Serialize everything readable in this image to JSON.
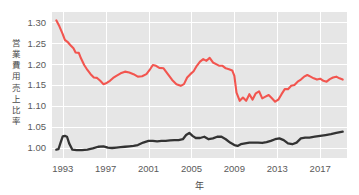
{
  "chart_data": {
    "type": "line",
    "title": "",
    "xlabel": "年",
    "ylabel": "営業費用売上比率",
    "xlim": [
      1992.0,
      2019.5
    ],
    "ylim": [
      0.975,
      1.325
    ],
    "grid": true,
    "legend": "none",
    "xticks": [
      1993,
      1997,
      2001,
      2005,
      2009,
      2013,
      2017
    ],
    "xtick_labels": [
      "1993",
      "1997",
      "2001",
      "2005",
      "2009",
      "2013",
      "2017"
    ],
    "yticks": [
      1.0,
      1.05,
      1.1,
      1.15,
      1.2,
      1.25,
      1.3
    ],
    "ytick_labels": [
      "1.00",
      "1.05",
      "1.10",
      "1.15",
      "1.20",
      "1.25",
      "1.30"
    ],
    "colors": {
      "series_red": "#f2554f",
      "series_black": "#333333",
      "plot_background": "#e6e6e6",
      "gridline": "#ffffff",
      "page_background": "#ffffff",
      "tick_text": "#5a5a5a"
    },
    "series": [
      {
        "name": "営業費用売上比率 (赤)",
        "color": "#f2554f",
        "x": [
          1992.4,
          1992.7,
          1993.0,
          1993.2,
          1993.5,
          1993.7,
          1994.0,
          1994.2,
          1994.5,
          1994.7,
          1995.0,
          1995.3,
          1995.6,
          1995.9,
          1996.2,
          1996.5,
          1996.8,
          1997.1,
          1997.4,
          1997.7,
          1998.0,
          1998.4,
          1998.8,
          1999.2,
          1999.6,
          2000.0,
          2000.4,
          2000.8,
          2001.1,
          2001.4,
          2001.7,
          2002.0,
          2002.4,
          2002.8,
          2003.2,
          2003.6,
          2004.0,
          2004.3,
          2004.6,
          2004.9,
          2005.2,
          2005.5,
          2005.8,
          2006.1,
          2006.4,
          2006.7,
          2007.0,
          2007.3,
          2007.6,
          2007.9,
          2008.2,
          2008.5,
          2008.8,
          2009.0,
          2009.2,
          2009.5,
          2009.8,
          2010.1,
          2010.4,
          2010.7,
          2011.0,
          2011.3,
          2011.6,
          2011.9,
          2012.2,
          2012.5,
          2012.8,
          2013.1,
          2013.4,
          2013.7,
          2014.0,
          2014.3,
          2014.6,
          2014.9,
          2015.2,
          2015.5,
          2015.8,
          2016.1,
          2016.4,
          2016.7,
          2017.0,
          2017.3,
          2017.6,
          2017.9,
          2018.2,
          2018.5,
          2018.8,
          2019.1
        ],
        "y": [
          1.305,
          1.29,
          1.272,
          1.258,
          1.252,
          1.246,
          1.238,
          1.228,
          1.227,
          1.214,
          1.198,
          1.186,
          1.176,
          1.168,
          1.167,
          1.16,
          1.152,
          1.155,
          1.16,
          1.167,
          1.172,
          1.178,
          1.182,
          1.18,
          1.176,
          1.17,
          1.171,
          1.176,
          1.186,
          1.198,
          1.196,
          1.191,
          1.19,
          1.176,
          1.162,
          1.152,
          1.148,
          1.152,
          1.168,
          1.176,
          1.183,
          1.196,
          1.206,
          1.212,
          1.208,
          1.215,
          1.204,
          1.2,
          1.196,
          1.196,
          1.19,
          1.188,
          1.185,
          1.172,
          1.132,
          1.112,
          1.12,
          1.112,
          1.128,
          1.115,
          1.13,
          1.135,
          1.118,
          1.122,
          1.126,
          1.118,
          1.11,
          1.115,
          1.128,
          1.14,
          1.14,
          1.148,
          1.15,
          1.158,
          1.163,
          1.17,
          1.174,
          1.17,
          1.166,
          1.163,
          1.165,
          1.16,
          1.158,
          1.164,
          1.168,
          1.17,
          1.166,
          1.163
        ]
      },
      {
        "name": "参照指数 (黒)",
        "color": "#333333",
        "x": [
          1992.4,
          1992.6,
          1992.8,
          1993.0,
          1993.2,
          1993.4,
          1993.6,
          1993.9,
          1994.3,
          1994.8,
          1995.3,
          1995.8,
          1996.3,
          1996.8,
          1997.2,
          1997.6,
          1998.0,
          1998.4,
          1998.8,
          1999.2,
          1999.6,
          2000.0,
          2000.5,
          2001.0,
          2001.4,
          2001.8,
          2002.2,
          2002.6,
          2003.0,
          2003.4,
          2003.8,
          2004.2,
          2004.5,
          2004.8,
          2005.1,
          2005.4,
          2005.8,
          2006.2,
          2006.6,
          2007.0,
          2007.4,
          2007.8,
          2008.2,
          2008.6,
          2009.0,
          2009.3,
          2009.6,
          2010.0,
          2010.4,
          2010.8,
          2011.2,
          2011.6,
          2012.0,
          2012.4,
          2012.8,
          2013.2,
          2013.6,
          2014.0,
          2014.4,
          2014.8,
          2015.2,
          2015.6,
          2016.0,
          2016.5,
          2017.0,
          2017.5,
          2018.0,
          2018.5,
          2019.1
        ],
        "y": [
          0.995,
          0.996,
          1.012,
          1.027,
          1.028,
          1.026,
          1.01,
          0.995,
          0.994,
          0.994,
          0.995,
          0.998,
          1.002,
          1.003,
          1.0,
          0.999,
          1.0,
          1.001,
          1.002,
          1.003,
          1.004,
          1.006,
          1.012,
          1.016,
          1.016,
          1.015,
          1.016,
          1.016,
          1.017,
          1.018,
          1.018,
          1.02,
          1.03,
          1.035,
          1.028,
          1.023,
          1.023,
          1.026,
          1.02,
          1.022,
          1.026,
          1.026,
          1.02,
          1.012,
          1.006,
          1.004,
          1.008,
          1.01,
          1.012,
          1.012,
          1.012,
          1.011,
          1.013,
          1.016,
          1.02,
          1.022,
          1.018,
          1.01,
          1.008,
          1.012,
          1.022,
          1.024,
          1.024,
          1.026,
          1.028,
          1.03,
          1.032,
          1.035,
          1.038
        ]
      }
    ]
  }
}
